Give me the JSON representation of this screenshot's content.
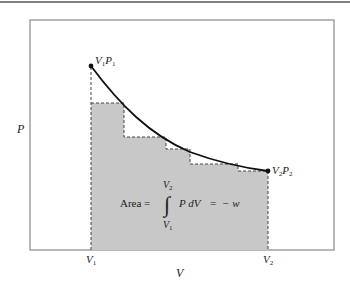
{
  "diagram": {
    "axis_labels": {
      "y": "P",
      "x": "V"
    },
    "points": {
      "start": {
        "label_v": "V",
        "sub_v": "1",
        "label_p": "P",
        "sub_p": "1"
      },
      "end": {
        "label_v": "V",
        "sub_v": "2",
        "label_p": "P",
        "sub_p": "2"
      }
    },
    "x_ticks": [
      {
        "label": "V",
        "sub": "1"
      },
      {
        "label": "V",
        "sub": "2"
      }
    ],
    "formula": {
      "lhs": "Area =",
      "upper_limit": "V",
      "upper_sub": "2",
      "lower_limit": "V",
      "lower_sub": "1",
      "integral_sign": "∫",
      "integrand": "P dV",
      "equals": "=",
      "rhs": "− w"
    },
    "colors": {
      "shade": "#c8c8c8",
      "curve": "#111111",
      "frame": "#888888",
      "dashes": "#444444"
    },
    "steps": [
      {
        "x0": 91,
        "x1": 124,
        "top": 103
      },
      {
        "x0": 124,
        "x1": 166,
        "top": 137
      },
      {
        "x0": 166,
        "x1": 190,
        "top": 149
      },
      {
        "x0": 190,
        "x1": 238,
        "top": 164
      },
      {
        "x0": 238,
        "x1": 268,
        "top": 171
      }
    ]
  }
}
